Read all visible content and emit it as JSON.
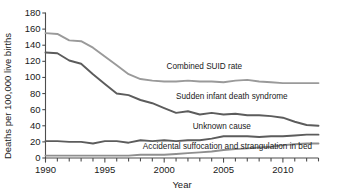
{
  "chart_data": {
    "type": "line",
    "title": "",
    "xlabel": "Year",
    "ylabel": "Deaths per 100,000 live births",
    "xlim": [
      1990,
      2013
    ],
    "ylim": [
      0,
      180
    ],
    "ytick_labels": [
      "180",
      "160",
      "140",
      "120",
      "100",
      "80",
      "60",
      "40",
      "20",
      "0"
    ],
    "ytick_values": [
      180,
      160,
      140,
      120,
      100,
      80,
      60,
      40,
      20,
      0
    ],
    "xtick_labels": [
      "1990",
      "1995",
      "2000",
      "2005",
      "2010"
    ],
    "xtick_values": [
      1990,
      1995,
      2000,
      2005,
      2010
    ],
    "grid": false,
    "legend_position": "inline-annotations",
    "x": [
      1990,
      1991,
      1992,
      1993,
      1994,
      1995,
      1996,
      1997,
      1998,
      1999,
      2000,
      2001,
      2002,
      2003,
      2004,
      2005,
      2006,
      2007,
      2008,
      2009,
      2010,
      2011,
      2012,
      2013
    ],
    "series": [
      {
        "name": "Combined SUID rate",
        "color": "#9a9a9a",
        "label_x": 2000.2,
        "label_y": 112,
        "values": [
          155,
          154,
          146,
          145,
          137,
          126,
          115,
          104,
          98,
          96,
          95,
          95,
          96,
          95,
          95,
          94,
          96,
          97,
          95,
          94,
          93,
          93,
          93,
          93
        ]
      },
      {
        "name": "Sudden infant death syndrome",
        "color": "#5c5c5c",
        "label_x": 2001.0,
        "label_y": 74,
        "values": [
          131,
          130,
          121,
          117,
          104,
          92,
          80,
          78,
          72,
          68,
          62,
          56,
          58,
          54,
          56,
          54,
          55,
          53,
          53,
          52,
          50,
          45,
          41,
          40
        ]
      },
      {
        "name": "Unknown cause",
        "color": "#5c5c5c",
        "label_x": 2002.4,
        "label_y": 37,
        "values": [
          21,
          21,
          20,
          20,
          18,
          21,
          21,
          19,
          22,
          21,
          22,
          21,
          22,
          22,
          24,
          27,
          27,
          27,
          26,
          27,
          27,
          28,
          29,
          29
        ]
      },
      {
        "name": "Accidental suffocation and strangulation in bed",
        "color": "#8f8f8f",
        "label_x": 1998.2,
        "label_y": 12,
        "values": [
          3,
          3,
          3,
          3,
          3,
          3,
          3,
          3,
          4,
          4,
          4,
          5,
          6,
          7,
          8,
          10,
          11,
          12,
          13,
          14,
          16,
          17,
          18,
          18
        ]
      }
    ]
  }
}
